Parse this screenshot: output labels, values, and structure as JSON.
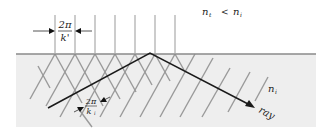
{
  "diagram": {
    "labels": {
      "index_relation": {
        "n_t": "n",
        "t_sub": "t",
        "lt": "<",
        "n_i": "n",
        "i_sub": "i"
      },
      "medium_label": {
        "n": "n",
        "sub": "i"
      },
      "transmitted_spacing": {
        "numerator": "2π",
        "denominator": "k'"
      },
      "incident_spacing": {
        "numerator": "2π",
        "denominator": "k",
        "den_sub": "i"
      },
      "ray_label": "ray"
    },
    "colors": {
      "background": "#ffffff",
      "medium_fill": "#eeeeee",
      "interface": "#8a8a8a",
      "wavefront": "#9a9a9a",
      "ray": "#1a1a1a"
    }
  }
}
